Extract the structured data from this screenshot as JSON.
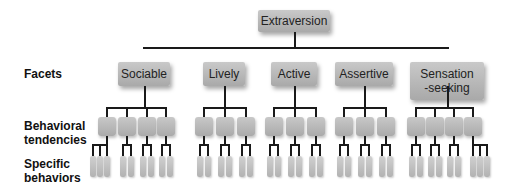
{
  "root": {
    "label": "Extraversion"
  },
  "row_labels": {
    "facets": "Facets",
    "tendencies_line1": "Behavioral",
    "tendencies_line2": "tendencies",
    "behaviors_line1": "Specific",
    "behaviors_line2": "behaviors"
  },
  "facets": [
    {
      "label": "Sociable",
      "label2": "",
      "tendencies": 4,
      "behaviors_per_tendency": [
        3,
        2,
        2,
        2
      ]
    },
    {
      "label": "Lively",
      "label2": "",
      "tendencies": 3,
      "behaviors_per_tendency": [
        2,
        2,
        2
      ]
    },
    {
      "label": "Active",
      "label2": "",
      "tendencies": 3,
      "behaviors_per_tendency": [
        2,
        2,
        2
      ]
    },
    {
      "label": "Assertive",
      "label2": "",
      "tendencies": 3,
      "behaviors_per_tendency": [
        2,
        2,
        2
      ]
    },
    {
      "label": "Sensation",
      "label2": "-seeking",
      "tendencies": 4,
      "behaviors_per_tendency": [
        2,
        2,
        2,
        3
      ]
    }
  ],
  "colors": {
    "box": "#b8b8b8",
    "line": "#1a1a1a",
    "text": "#222222"
  }
}
